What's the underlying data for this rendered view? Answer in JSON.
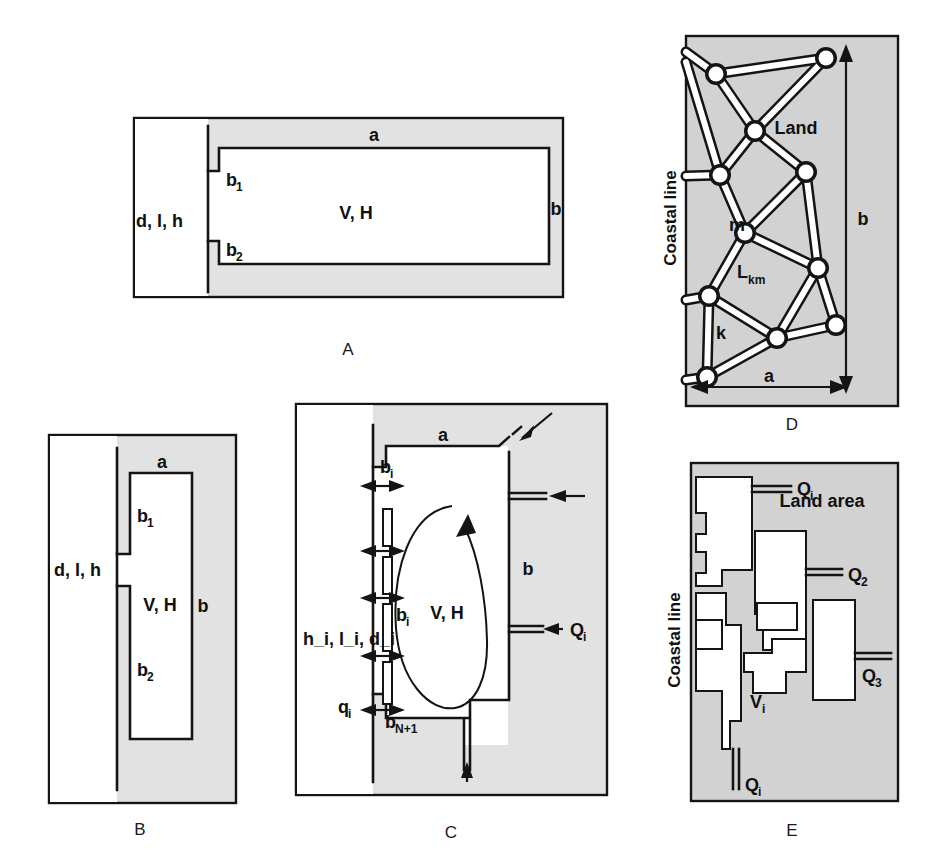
{
  "figure": {
    "background_color": "#ffffff",
    "shade_color": "#e2e2e2",
    "line_color": "#141414"
  },
  "panels": [
    {
      "id": "A",
      "letter": "A",
      "labels": {
        "aquifer_params": "d, l, h",
        "top_dim": "a",
        "right_dim": "b",
        "segment_1": "b",
        "segment_1_sub": "1",
        "segment_2": "b",
        "segment_2_sub": "2",
        "interior": "V, H"
      }
    },
    {
      "id": "B",
      "letter": "B",
      "labels": {
        "aquifer_params": "d, l, h",
        "top_dim": "a",
        "right_dim": "b",
        "segment_1": "b",
        "segment_1_sub": "1",
        "segment_2": "b",
        "segment_2_sub": "2",
        "interior": "V, H"
      }
    },
    {
      "id": "C",
      "letter": "C",
      "labels": {
        "top_dim": "a",
        "right_dim": "b",
        "interior": "V, H",
        "segment_top": "b",
        "segment_top_sub": "i",
        "segment_mid": "b",
        "segment_mid_sub": "i",
        "segment_bottom": "b",
        "segment_bottom_sub": "N+1",
        "strip_params": "h",
        "strip_params_full": "h_i, l_i, d_i",
        "flux_small": "q",
        "flux_small_sub": "i",
        "discharge": "Q",
        "discharge_sub": "i"
      }
    },
    {
      "id": "D",
      "letter": "D",
      "labels": {
        "coastal_line": "Coastal line",
        "land": "Land",
        "node_m": "m",
        "node_k": "k",
        "link": "L",
        "link_sub": "km",
        "width_dim": "a",
        "height_dim": "b"
      },
      "network": {
        "nodes": [
          {
            "name": "n1",
            "x": 716,
            "y": 74
          },
          {
            "name": "n2",
            "x": 826,
            "y": 58
          },
          {
            "name": "n3",
            "x": 755,
            "y": 131
          },
          {
            "name": "n4",
            "x": 720,
            "y": 175
          },
          {
            "name": "n5",
            "x": 806,
            "y": 172
          },
          {
            "name": "n6",
            "x": 745,
            "y": 233
          },
          {
            "name": "n7",
            "x": 818,
            "y": 268
          },
          {
            "name": "n8",
            "x": 709,
            "y": 296
          },
          {
            "name": "n9",
            "x": 836,
            "y": 325
          },
          {
            "name": "n10",
            "x": 777,
            "y": 338
          },
          {
            "name": "n11",
            "x": 707,
            "y": 377
          }
        ],
        "links": [
          [
            "n1",
            "n2"
          ],
          [
            "n1",
            "n3"
          ],
          [
            "n2",
            "n3"
          ],
          [
            "n3",
            "n4"
          ],
          [
            "n3",
            "n5"
          ],
          [
            "n4",
            "n6"
          ],
          [
            "n5",
            "n6"
          ],
          [
            "n5",
            "n7"
          ],
          [
            "n6",
            "n7"
          ],
          [
            "n6",
            "n8"
          ],
          [
            "n7",
            "n9"
          ],
          [
            "n7",
            "n10"
          ],
          [
            "n8",
            "n10"
          ],
          [
            "n8",
            "n11"
          ],
          [
            "n9",
            "n10"
          ],
          [
            "n10",
            "n11"
          ]
        ]
      }
    },
    {
      "id": "E",
      "letter": "E",
      "labels": {
        "coastal_line": "Coastal line",
        "land_area": "Land area",
        "discharge_i_top": "Q",
        "discharge_i_top_sub": "i",
        "discharge_2": "Q",
        "discharge_2_sub": "2",
        "discharge_3": "Q",
        "discharge_3_sub": "3",
        "volume_i": "V",
        "volume_i_sub": "i",
        "discharge_i_bottom": "Q",
        "discharge_i_bottom_sub": "i"
      }
    }
  ]
}
